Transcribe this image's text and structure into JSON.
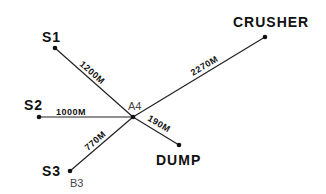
{
  "diagram": {
    "type": "haul-road network",
    "junction": {
      "id": "A4",
      "label": "A4",
      "x": 133,
      "y": 117
    },
    "nodes": [
      {
        "id": "S1",
        "label": "S1",
        "x": 55,
        "y": 48
      },
      {
        "id": "S2",
        "label": "S2",
        "x": 39,
        "y": 117
      },
      {
        "id": "S3",
        "label": "S3",
        "x": 70,
        "y": 171,
        "sublabel": "B3"
      },
      {
        "id": "CRUSHER",
        "label": "CRUSHER",
        "x": 265,
        "y": 37
      },
      {
        "id": "DUMP",
        "label": "DUMP",
        "x": 179,
        "y": 145
      }
    ],
    "edges": [
      {
        "from": "S1",
        "to": "A4",
        "distance": "1200M"
      },
      {
        "from": "S2",
        "to": "A4",
        "distance": "1000M"
      },
      {
        "from": "S3",
        "to": "A4",
        "distance": "770M"
      },
      {
        "from": "A4",
        "to": "CRUSHER",
        "distance": "2270M"
      },
      {
        "from": "A4",
        "to": "DUMP",
        "distance": "190M"
      }
    ]
  },
  "labels": {
    "s1": "S1",
    "s2": "S2",
    "s3": "S3",
    "b3": "B3",
    "a4": "A4",
    "crusher": "CRUSHER",
    "dump": "DUMP",
    "e_s1": "1200M",
    "e_s2": "1000M",
    "e_s3": "770M",
    "e_crusher": "2270M",
    "e_dump": "190M"
  }
}
